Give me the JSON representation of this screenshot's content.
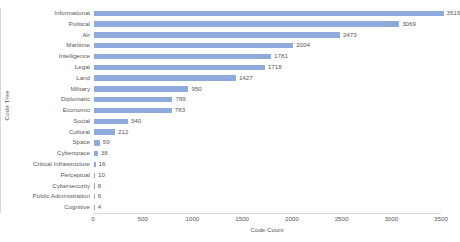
{
  "chart_data": {
    "type": "bar",
    "orientation": "horizontal",
    "title": "",
    "xlabel": "Code Count",
    "ylabel": "Code Tree",
    "categories": [
      "Informational",
      "Political",
      "Air",
      "Maritime",
      "Intelligence",
      "Legal",
      "Land",
      "Military",
      "Diplomatic",
      "Economic",
      "Social",
      "Cultural",
      "Space",
      "Cyberspace",
      "Critical Infrastructure",
      "Perceptual",
      "Cybersecurity",
      "Public Administration",
      "Cognitive"
    ],
    "values": [
      3516,
      3069,
      2473,
      2004,
      1781,
      1718,
      1427,
      950,
      789,
      783,
      340,
      212,
      59,
      38,
      16,
      10,
      8,
      6,
      4
    ],
    "value_labels": [
      "3516",
      "3069",
      "2473",
      "2004",
      "1781",
      "1718",
      "1427",
      "950",
      "789",
      "783",
      "340",
      "212",
      "59",
      "38",
      "16",
      "10",
      "8",
      "6",
      "4"
    ],
    "xticks": [
      0,
      500,
      1000,
      1500,
      2000,
      2500,
      3000,
      3500
    ],
    "xtick_labels": [
      "0",
      "500",
      "1000",
      "1500",
      "2000",
      "2500",
      "3000",
      "3500"
    ],
    "xlim": [
      0,
      3500
    ],
    "grid": false,
    "legend": false,
    "bar_color": "#8faadc",
    "text_color": "#595959",
    "axis_color": "#d9d9d9",
    "background": "#ffffff"
  }
}
